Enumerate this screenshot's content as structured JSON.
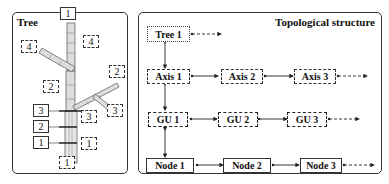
{
  "left_panel": {
    "title": "Tree",
    "stem_labels_solid": [
      "1",
      "2",
      "3",
      "1"
    ],
    "axis_labels_dashed": [
      "4",
      "2",
      "2",
      "3",
      "3",
      "1",
      "1"
    ]
  },
  "right_panel": {
    "title": "Topological structure",
    "rows": [
      {
        "name": "tree-row",
        "items": [
          "Tree 1"
        ],
        "border": "dotted"
      },
      {
        "name": "axis-row",
        "items": [
          "Axis 1",
          "Axis 2",
          "Axis 3"
        ],
        "border": "dash-dot"
      },
      {
        "name": "gu-row",
        "items": [
          "GU 1",
          "GU 2",
          "GU 3"
        ],
        "border": "dashed"
      },
      {
        "name": "node-row",
        "items": [
          "Node 1",
          "Node 2",
          "Node 3"
        ],
        "border": "solid"
      }
    ]
  }
}
